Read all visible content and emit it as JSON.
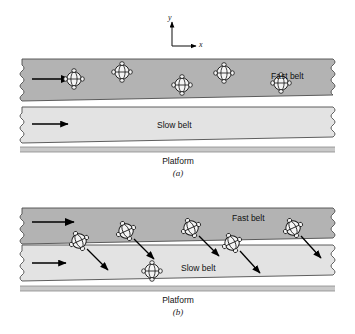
{
  "figure": {
    "axes": {
      "y_label": "y",
      "x_label": "x"
    },
    "colors": {
      "fast_belt_fill": "#b3b3b3",
      "slow_belt_fill": "#e3e3e3",
      "platform_fill": "#c9c9c9",
      "outline": "#4d4d4d",
      "arrow": "#000000",
      "particle_fill": "#f2f2f2",
      "particle_outline": "#111111",
      "background": "#ffffff"
    },
    "panels": [
      {
        "id": "a",
        "caption": "(a)",
        "fast_belt_label": "Fast belt",
        "slow_belt_label": "Slow belt",
        "platform_label": "Platform",
        "fast_belt_arrow_direction": "right",
        "slow_belt_arrow_direction": "right",
        "particles": [
          {
            "index": 1,
            "x": 74,
            "y": 79,
            "belt": "fast",
            "tilt": 0,
            "has_velocity_arrow": false
          },
          {
            "index": 2,
            "x": 122,
            "y": 72,
            "belt": "fast",
            "tilt": 0,
            "has_velocity_arrow": false
          },
          {
            "index": 3,
            "x": 182,
            "y": 85,
            "belt": "fast",
            "tilt": 0,
            "has_velocity_arrow": false
          },
          {
            "index": 4,
            "x": 224,
            "y": 73,
            "belt": "fast",
            "tilt": 0,
            "has_velocity_arrow": false
          },
          {
            "index": 5,
            "x": 281,
            "y": 83,
            "belt": "fast",
            "tilt": 0,
            "has_velocity_arrow": false
          }
        ]
      },
      {
        "id": "b",
        "caption": "(b)",
        "fast_belt_label": "Fast belt",
        "slow_belt_label": "Slow belt",
        "platform_label": "Platform",
        "fast_belt_arrow_direction": "right",
        "slow_belt_arrow_direction": "right",
        "particles": [
          {
            "index": 1,
            "x": 79,
            "y": 241,
            "belt": "boundary",
            "tilt": -25,
            "has_velocity_arrow": true,
            "arrow_dx": 24,
            "arrow_dy": 24
          },
          {
            "index": 2,
            "x": 126,
            "y": 231,
            "belt": "fast",
            "tilt": -25,
            "has_velocity_arrow": true,
            "arrow_dx": 22,
            "arrow_dy": 22
          },
          {
            "index": 3,
            "x": 191,
            "y": 228,
            "belt": "fast",
            "tilt": -25,
            "has_velocity_arrow": true,
            "arrow_dx": 22,
            "arrow_dy": 22
          },
          {
            "index": 4,
            "x": 232,
            "y": 243,
            "belt": "boundary",
            "tilt": -25,
            "has_velocity_arrow": true,
            "arrow_dx": 24,
            "arrow_dy": 24
          },
          {
            "index": 5,
            "x": 293,
            "y": 228,
            "belt": "fast",
            "tilt": -25,
            "has_velocity_arrow": true,
            "arrow_dx": 22,
            "arrow_dy": 24
          },
          {
            "index": 6,
            "x": 152,
            "y": 271,
            "belt": "slow",
            "tilt": 0,
            "has_velocity_arrow": false
          }
        ]
      }
    ]
  }
}
